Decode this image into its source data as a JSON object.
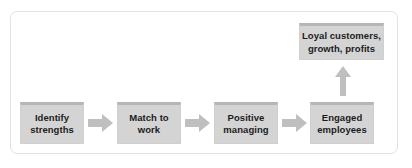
{
  "figure": {
    "type": "process-flow-diagram",
    "title": "",
    "frame": {
      "border_color": "#e2e2e2",
      "background": "#ffffff"
    },
    "colors": {
      "node_fill": "#d4d4d4",
      "node_top_bar": "#b6b6b6",
      "node_border": "#cfcfcf",
      "arrow_fill": "#bfbfbf",
      "text": "#1c1c1c"
    },
    "nodes": [
      {
        "id": "identify",
        "label": "Identify\nstrengths",
        "line1": "Identify",
        "line2": "strengths"
      },
      {
        "id": "match",
        "label": "Match to\nwork",
        "line1": "Match to",
        "line2": "work"
      },
      {
        "id": "positive",
        "label": "Positive\nmanaging",
        "line1": "Positive",
        "line2": "managing"
      },
      {
        "id": "engaged",
        "label": "Engaged\nemployees",
        "line1": "Engaged",
        "line2": "employees"
      },
      {
        "id": "loyal",
        "label": "Loyal customers,\ngrowth, profits",
        "line1": "Loyal customers,",
        "line2": "growth, profits"
      }
    ],
    "arrows": [
      {
        "id": "arrow-1",
        "from": "identify",
        "to": "match",
        "direction": "right"
      },
      {
        "id": "arrow-2",
        "from": "match",
        "to": "positive",
        "direction": "right"
      },
      {
        "id": "arrow-3",
        "from": "positive",
        "to": "engaged",
        "direction": "right"
      },
      {
        "id": "arrow-up",
        "from": "engaged",
        "to": "loyal",
        "direction": "up"
      }
    ]
  }
}
